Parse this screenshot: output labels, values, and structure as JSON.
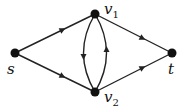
{
  "diagram": {
    "type": "directed-graph",
    "nodes": [
      {
        "id": "s",
        "label": "s",
        "sub": "",
        "x": 15,
        "y": 53
      },
      {
        "id": "v1",
        "label": "v",
        "sub": "1",
        "x": 95,
        "y": 14
      },
      {
        "id": "v2",
        "label": "v",
        "sub": "2",
        "x": 95,
        "y": 92
      },
      {
        "id": "t",
        "label": "t",
        "sub": "",
        "x": 172,
        "y": 53
      }
    ],
    "edges": [
      {
        "from": "s",
        "to": "v1"
      },
      {
        "from": "s",
        "to": "v2"
      },
      {
        "from": "v1",
        "to": "t"
      },
      {
        "from": "v2",
        "to": "t"
      },
      {
        "from": "v1",
        "to": "v2",
        "curve": "left"
      },
      {
        "from": "v2",
        "to": "v1",
        "curve": "right"
      }
    ],
    "colors": {
      "edge": "#222222",
      "node": "#111111",
      "background": "#ffffff"
    }
  }
}
